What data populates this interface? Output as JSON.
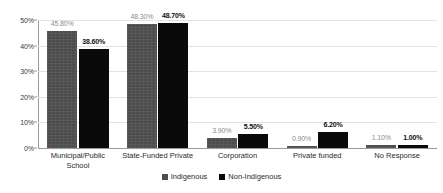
{
  "chart_data": {
    "type": "bar",
    "title": "",
    "subtitle": "",
    "xlabel": "",
    "ylabel": "",
    "ylim": [
      0,
      50
    ],
    "ytick_labels": [
      "0%",
      "10%",
      "20%",
      "30%",
      "40%",
      "50%"
    ],
    "ytick_values": [
      0,
      10,
      20,
      30,
      40,
      50
    ],
    "grid": true,
    "legend_position": "bottom-center",
    "categories": [
      "Municipal/Public\nSchool",
      "State-Funded Private",
      "Corporation",
      "Private funded",
      "No Response"
    ],
    "series": [
      {
        "name": "Indigenous",
        "color": "#4d4d4d",
        "values": [
          45.8,
          48.3,
          3.9,
          0.9,
          1.1
        ],
        "labels": [
          "45.80%",
          "48.30%",
          "3.90%",
          "0.90%",
          "1.10%"
        ]
      },
      {
        "name": "Non-Indigenous",
        "color": "#0a0a0a",
        "values": [
          38.6,
          48.7,
          5.5,
          6.2,
          1.0
        ],
        "labels": [
          "38.60%",
          "48.70%",
          "5.50%",
          "6.20%",
          "1.00%"
        ]
      }
    ]
  },
  "legend": {
    "items": [
      {
        "label": "Indigenous",
        "color": "#4d4d4d"
      },
      {
        "label": "Non-Indigenous",
        "color": "#0a0a0a"
      }
    ]
  },
  "colors": {
    "background": "#ffffff",
    "gridline": "#e2e2e2",
    "axis": "#9a9a9a",
    "indigenous": "#4d4d4d",
    "non_indigenous": "#0a0a0a",
    "indigenous_label_text": "#8d8d8d",
    "non_indigenous_label_text": "#101010"
  }
}
